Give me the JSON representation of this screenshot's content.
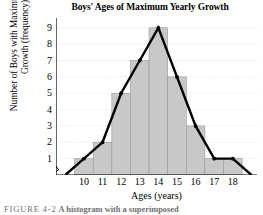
{
  "figure": {
    "caption_label": "FIGURE 4-2",
    "caption_text": "A histogram with a superimposed"
  },
  "chart_data": {
    "type": "bar",
    "title": "Boys' Ages of Maximum Yearly Growth",
    "xlabel": "Ages (years)",
    "ylabel": "Number of Boys with Maximum Yearly Growth (frequency)",
    "categories": [
      "10",
      "11",
      "12",
      "13",
      "14",
      "15",
      "16",
      "17",
      "18"
    ],
    "values": [
      1,
      2,
      5,
      7,
      9,
      6,
      3,
      1,
      1
    ],
    "yticks": [
      "9",
      "8",
      "7",
      "6",
      "5",
      "4",
      "3",
      "2",
      "1"
    ],
    "ylim": [
      0,
      9.6
    ],
    "xlim": [
      8.5,
      19.3
    ],
    "grid": true,
    "legend": "none",
    "axis_break": true,
    "bar_color": "#c8c8c8",
    "bar_edge_color": "#9a9a9a",
    "grid_color": "#d8d8d8",
    "axis_color": "#000000",
    "overlay": {
      "type": "line",
      "name": "frequency polygon",
      "color": "#000000",
      "x": [
        9,
        10,
        11,
        12,
        13,
        14,
        15,
        16,
        17,
        18,
        19
      ],
      "y": [
        0,
        1,
        2,
        5,
        7,
        9,
        6,
        3,
        1,
        1,
        0
      ]
    }
  }
}
